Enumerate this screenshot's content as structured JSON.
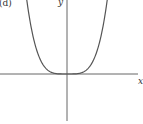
{
  "panel_label": "(d)",
  "axes": {
    "x_label": "x",
    "y_label": "y"
  },
  "colors": {
    "axis": "#555555",
    "curve": "#555555",
    "background": "#ffffff"
  },
  "chart_data": {
    "type": "line",
    "title": "",
    "panel": "(d)",
    "xlabel": "x",
    "ylabel": "y",
    "function": "y = x^4 (even-power curve, flat minimum at origin)",
    "series": [
      {
        "name": "curve",
        "x": [
          -1.0,
          -0.9,
          -0.8,
          -0.7,
          -0.6,
          -0.5,
          -0.4,
          -0.3,
          -0.2,
          -0.1,
          0,
          0.1,
          0.2,
          0.3,
          0.4,
          0.5,
          0.6,
          0.7,
          0.8,
          0.9,
          1.0
        ],
        "values": [
          1.0,
          0.6561,
          0.4096,
          0.2401,
          0.1296,
          0.0625,
          0.0256,
          0.0081,
          0.0016,
          0.0001,
          0,
          0.0001,
          0.0016,
          0.0081,
          0.0256,
          0.0625,
          0.1296,
          0.2401,
          0.4096,
          0.6561,
          1.0
        ]
      }
    ],
    "grid": false,
    "ticks": "none",
    "legend": "none"
  }
}
